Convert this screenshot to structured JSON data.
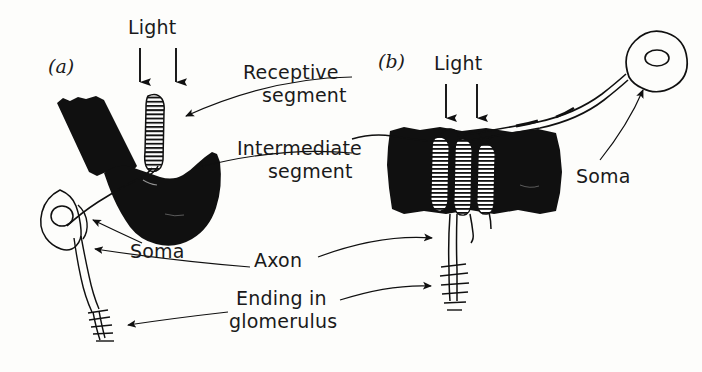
{
  "figure": {
    "background_color": "#fdfdfb",
    "ink_color": "#101010",
    "panels": [
      {
        "id": "a",
        "label": "(a)",
        "x": 48,
        "y": 55
      },
      {
        "id": "b",
        "label": "(b)",
        "x": 378,
        "y": 50
      }
    ]
  },
  "labels": {
    "light_a": "Light",
    "light_b": "Light",
    "receptive_line1": "Receptive",
    "receptive_line2": "segment",
    "intermediate_line1": "Intermediate",
    "intermediate_line2": "segment",
    "soma_a": "Soma",
    "soma_b": "Soma",
    "axon": "Axon",
    "glomerulus_line1": "Ending in",
    "glomerulus_line2": "glomerulus"
  },
  "annotations": [
    {
      "name": "light-arrows-a",
      "count": 2,
      "direction": "down"
    },
    {
      "name": "light-arrows-b",
      "count": 2,
      "direction": "down"
    },
    {
      "name": "receptive-segment-leader",
      "target_panel": "a"
    },
    {
      "name": "intermediate-segment-leader",
      "target_panel": "a"
    },
    {
      "name": "soma-leader-a",
      "target_panel": "a"
    },
    {
      "name": "soma-leader-b",
      "target_panel": "b"
    },
    {
      "name": "axon-leader-a",
      "target_panel": "a"
    },
    {
      "name": "axon-leader-b",
      "target_panel": "b"
    },
    {
      "name": "glomerulus-leader-a",
      "target_panel": "a"
    },
    {
      "name": "glomerulus-leader-b",
      "target_panel": "b"
    }
  ],
  "structures": {
    "panel_a": {
      "pigment_masses": 2,
      "receptive_segments": 1,
      "soma": 1,
      "glomerulus_endings": 1
    },
    "panel_b": {
      "pigment_masses": 1,
      "receptive_segments": 3,
      "soma": 1,
      "glomerulus_endings": 1
    }
  }
}
